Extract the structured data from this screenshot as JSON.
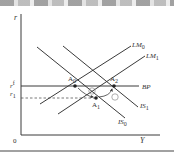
{
  "diagram": {
    "type": "IS-LM-BP",
    "axes": {
      "y_label": "r",
      "x_label": "Y",
      "origin_label": "0"
    },
    "rate_labels": {
      "world_rate": "r",
      "world_rate_sup": "f",
      "r1": "r",
      "r1_sub": "1"
    },
    "curves": [
      {
        "id": "LM0",
        "label": "LM",
        "sub": "0"
      },
      {
        "id": "LM1",
        "label": "LM",
        "sub": "1"
      },
      {
        "id": "IS0",
        "label": "IS",
        "sub": "0"
      },
      {
        "id": "IS1",
        "label": "IS",
        "sub": "1"
      },
      {
        "id": "BP",
        "label": "BP",
        "sub": ""
      }
    ],
    "points": [
      {
        "id": "A0",
        "label": "A",
        "sub": "0"
      },
      {
        "id": "A1",
        "label": "A",
        "sub": "1"
      },
      {
        "id": "A2",
        "label": "A",
        "sub": "2"
      }
    ],
    "arrows": [
      {
        "id": "step1",
        "label": "①"
      },
      {
        "id": "step2",
        "label": "②"
      }
    ],
    "colors": {
      "line": "#3a3a3a",
      "text": "#333333",
      "background": "#ffffff"
    }
  }
}
